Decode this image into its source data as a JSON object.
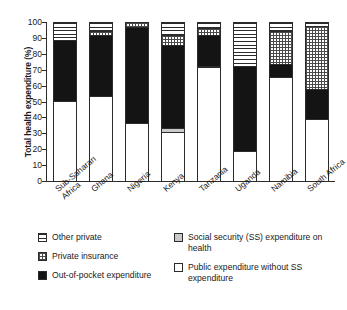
{
  "chart_data": {
    "type": "bar",
    "subtype": "stacked-percentage-column",
    "title": "",
    "xlabel": "",
    "ylabel": "Total health expenditure (%)",
    "ylim": [
      0,
      100
    ],
    "yticks": [
      0,
      10,
      20,
      30,
      40,
      50,
      60,
      70,
      80,
      90,
      100
    ],
    "grid": false,
    "legend_position": "bottom",
    "categories": [
      "Sub-Saharan Africa",
      "Ghana",
      "Nigeria",
      "Kenya",
      "Tanzania",
      "Uganda",
      "Namibia",
      "South Africa"
    ],
    "category_lines": [
      [
        "Sub-Saharan",
        "Africa"
      ],
      [
        "Ghana"
      ],
      [
        "Nigeria"
      ],
      [
        "Kenya"
      ],
      [
        "Tanzania"
      ],
      [
        "Uganda"
      ],
      [
        "Namibia"
      ],
      [
        "South Africa"
      ]
    ],
    "series": [
      {
        "name": "Public expenditure without SS expenditure",
        "key": "public",
        "pattern": "plain-white",
        "color": "#ffffff",
        "values": [
          50,
          53,
          36,
          30,
          71,
          18.5,
          65,
          38.5
        ]
      },
      {
        "name": "Social security (SS) expenditure on health",
        "key": "ss",
        "pattern": "light-grey",
        "color": "#c9c9c9",
        "values": [
          0,
          0,
          0,
          3,
          1,
          0,
          0,
          0
        ]
      },
      {
        "name": "Out-of-pocket expenditure",
        "key": "out_of_pocket",
        "pattern": "solid-black",
        "color": "#141414",
        "values": [
          38,
          38,
          60.5,
          52,
          19.5,
          53,
          8,
          19
        ]
      },
      {
        "name": "Private insurance",
        "key": "private_insurance",
        "pattern": "checker",
        "color": "#ffffff",
        "values": [
          0,
          3,
          3.5,
          6,
          4,
          0,
          21,
          39.5
        ]
      },
      {
        "name": "Other private",
        "key": "other_private",
        "pattern": "horizontal-stripes",
        "color": "#ffffff",
        "values": [
          12,
          6,
          0,
          9,
          4.5,
          28.5,
          6,
          3
        ]
      }
    ]
  },
  "legend": {
    "left_column": [
      {
        "label": "Other private",
        "pattern": "horizontal-stripes"
      },
      {
        "label": "Private insurance",
        "pattern": "checker"
      },
      {
        "label": "Out-of-pocket expenditure",
        "pattern": "solid-black"
      }
    ],
    "right_column": [
      {
        "label": "Social security (SS) expenditure on health",
        "pattern": "light-grey"
      },
      {
        "label": "Public expenditure without SS expenditure",
        "pattern": "plain-white"
      }
    ]
  },
  "colors": {
    "axis": "#2b2b2b",
    "text": "#1a1a1a",
    "background": "#ffffff",
    "out_of_pocket": "#141414",
    "social_security": "#c9c9c9",
    "public": "#ffffff"
  }
}
